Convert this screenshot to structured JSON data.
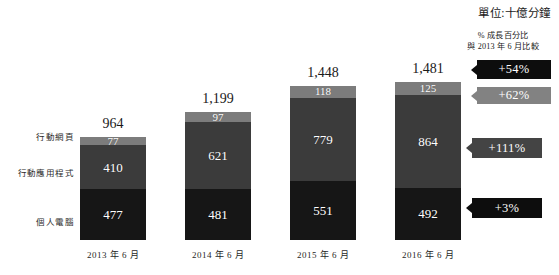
{
  "unit_note": "單位:十億分鐘",
  "growth_header": {
    "line1": "% 成長百分比",
    "line2": "與 2013 年 6 月比較"
  },
  "category_labels": {
    "mobile_web": "行動網頁",
    "mobile_app": "行動應用程式",
    "pc": "個人電腦"
  },
  "badges": [
    {
      "label": "+54%",
      "style": "dark"
    },
    {
      "label": "+62%",
      "style": "light"
    },
    {
      "label": "+111%",
      "style": "mid"
    },
    {
      "label": "+3%",
      "style": "dark"
    }
  ],
  "chart_data": {
    "type": "bar",
    "subtype": "stacked",
    "title": "",
    "unit": "單位:十億分鐘",
    "xlabel": "",
    "ylabel": "",
    "grid": false,
    "legend_position": "left-axis-labels",
    "categories": [
      "2013 年 6 月",
      "2014 年 6 月",
      "2015 年 6 月",
      "2016 年 6 月"
    ],
    "series": [
      {
        "name": "個人電腦",
        "values": [
          477,
          481,
          551,
          492
        ]
      },
      {
        "name": "行動應用程式",
        "values": [
          410,
          621,
          779,
          864
        ]
      },
      {
        "name": "行動網頁",
        "values": [
          77,
          97,
          118,
          125
        ]
      }
    ],
    "totals": [
      964,
      1199,
      1448,
      1481
    ],
    "total_labels": [
      "964",
      "1,199",
      "1,448",
      "1,481"
    ],
    "value_labels": {
      "個人電腦": [
        "477",
        "481",
        "551",
        "492"
      ],
      "行動應用程式": [
        "410",
        "621",
        "779",
        "864"
      ],
      "行動網頁": [
        "77",
        "97",
        "118",
        "125"
      ]
    },
    "annotations": [
      {
        "series": "總計",
        "label": "+54%",
        "compare_to": "2013 年 6 月"
      },
      {
        "series": "行動網頁",
        "label": "+62%",
        "compare_to": "2013 年 6 月"
      },
      {
        "series": "行動應用程式",
        "label": "+111%",
        "compare_to": "2013 年 6 月"
      },
      {
        "series": "個人電腦",
        "label": "+3%",
        "compare_to": "2013 年 6 月"
      }
    ],
    "ylim": [
      0,
      1481
    ],
    "colors": {
      "行動網頁": "#7c7c7c",
      "行動應用程式": "#3b3b3b",
      "個人電腦": "#161616",
      "badge_dark": "#0d0d0d",
      "badge_light": "#828282",
      "badge_mid": "#444444"
    }
  }
}
